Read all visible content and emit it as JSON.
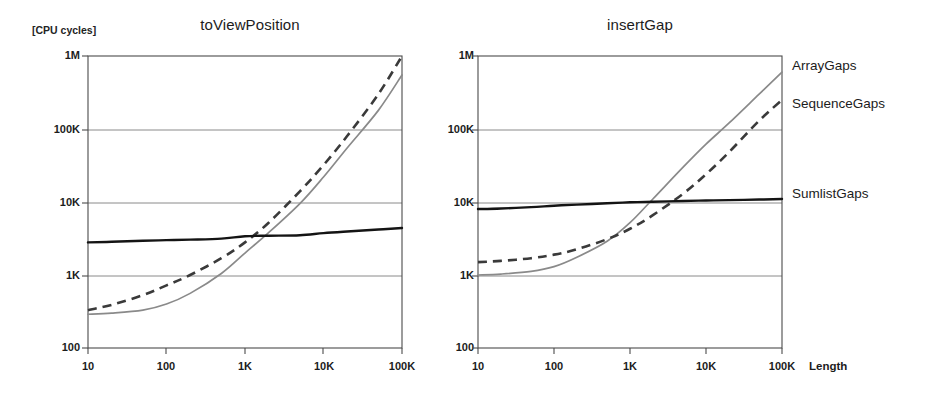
{
  "figure": {
    "unit_label": "[CPU cycles]",
    "xaxis_name": "Length"
  },
  "legend": {
    "items": [
      {
        "label": "ArrayGaps",
        "style": "solid-gray",
        "color": "#8a8a8a"
      },
      {
        "label": "SequenceGaps",
        "style": "dashed-dark",
        "color": "#3a3a3a"
      },
      {
        "label": "SumlistGaps",
        "style": "solid-black",
        "color": "#141414"
      }
    ]
  },
  "panels": [
    {
      "id": "left",
      "title": "toViewPosition"
    },
    {
      "id": "right",
      "title": "insertGap"
    }
  ],
  "axes": {
    "ylabels": [
      "1M",
      "100K",
      "10K",
      "1K",
      "100"
    ],
    "yvalues": [
      1000000,
      100000,
      10000,
      1000,
      100
    ],
    "xlabels": [
      "10",
      "100",
      "1K",
      "10K",
      "100K"
    ],
    "xvalues": [
      10,
      100,
      1000,
      10000,
      100000
    ]
  },
  "chart_data": [
    {
      "type": "line",
      "title": "toViewPosition",
      "xlabel": "Length",
      "ylabel": "[CPU cycles]",
      "xscale": "log",
      "yscale": "log",
      "xlim": [
        10,
        100000
      ],
      "ylim": [
        100,
        1000000
      ],
      "grid": true,
      "legend_position": "right",
      "x": [
        10,
        20,
        50,
        100,
        200,
        500,
        1000,
        2000,
        5000,
        10000,
        20000,
        50000,
        100000
      ],
      "series": [
        {
          "name": "ArrayGaps",
          "values": [
            290,
            300,
            330,
            400,
            560,
            1050,
            2000,
            3800,
            9500,
            22000,
            55000,
            180000,
            550000
          ]
        },
        {
          "name": "SequenceGaps",
          "values": [
            330,
            390,
            530,
            720,
            1000,
            1700,
            2800,
            5200,
            14000,
            32000,
            80000,
            300000,
            1000000
          ]
        },
        {
          "name": "SumlistGaps",
          "values": [
            2800,
            2850,
            2950,
            3000,
            3050,
            3150,
            3400,
            3450,
            3500,
            3750,
            3950,
            4200,
            4400
          ]
        }
      ]
    },
    {
      "type": "line",
      "title": "insertGap",
      "xlabel": "Length",
      "ylabel": "[CPU cycles]",
      "xscale": "log",
      "yscale": "log",
      "xlim": [
        10,
        100000
      ],
      "ylim": [
        100,
        1000000
      ],
      "grid": true,
      "legend_position": "right",
      "x": [
        10,
        20,
        50,
        100,
        200,
        500,
        1000,
        2000,
        5000,
        10000,
        20000,
        50000,
        100000
      ],
      "series": [
        {
          "name": "ArrayGaps",
          "values": [
            1000,
            1030,
            1120,
            1300,
            1750,
            2900,
            5200,
            11000,
            30000,
            62000,
            120000,
            300000,
            600000
          ]
        },
        {
          "name": "SequenceGaps",
          "values": [
            1500,
            1560,
            1700,
            1900,
            2250,
            3100,
            4300,
            6600,
            13000,
            24000,
            48000,
            130000,
            250000
          ]
        },
        {
          "name": "SumlistGaps",
          "values": [
            8000,
            8150,
            8500,
            8900,
            9200,
            9600,
            9900,
            10100,
            10300,
            10500,
            10600,
            10800,
            11000
          ]
        }
      ]
    }
  ]
}
